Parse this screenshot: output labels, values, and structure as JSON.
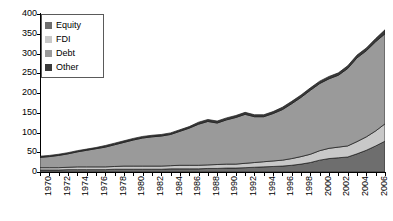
{
  "chart_data": {
    "type": "area",
    "stacked": true,
    "title": "",
    "xlabel": "",
    "ylabel": "",
    "ylim": [
      0,
      400
    ],
    "ytick_values": [
      0,
      50,
      100,
      150,
      200,
      250,
      300,
      350,
      400
    ],
    "grid": false,
    "legend_position": "top-left",
    "x": [
      1970,
      1971,
      1972,
      1973,
      1974,
      1975,
      1976,
      1977,
      1978,
      1979,
      1980,
      1981,
      1982,
      1983,
      1984,
      1985,
      1986,
      1987,
      1988,
      1989,
      1990,
      1991,
      1992,
      1993,
      1994,
      1995,
      1996,
      1997,
      1998,
      1999,
      2000,
      2001,
      2002,
      2003,
      2004,
      2005,
      2006,
      2007
    ],
    "xtick_labels": [
      "1970",
      "1972",
      "1974",
      "1976",
      "1978",
      "1980",
      "1982",
      "1984",
      "1986",
      "1988",
      "1990",
      "1992",
      "1994",
      "1996",
      "1998",
      "2000",
      "2002",
      "2004",
      "2006"
    ],
    "series": [
      {
        "name": "Equity",
        "color": "#6e6e6e",
        "values": [
          5,
          5,
          5,
          6,
          6,
          6,
          6,
          6,
          7,
          7,
          7,
          7,
          7,
          7,
          8,
          8,
          8,
          8,
          9,
          9,
          10,
          10,
          11,
          12,
          13,
          14,
          15,
          17,
          20,
          24,
          30,
          34,
          36,
          38,
          46,
          55,
          66,
          78
        ]
      },
      {
        "name": "FDI",
        "color": "#c8c8c8",
        "values": [
          6,
          6,
          6,
          6,
          7,
          7,
          7,
          7,
          7,
          8,
          8,
          8,
          8,
          8,
          8,
          9,
          9,
          9,
          9,
          10,
          10,
          10,
          11,
          12,
          13,
          14,
          15,
          17,
          19,
          21,
          24,
          26,
          27,
          28,
          31,
          34,
          38,
          44
        ]
      },
      {
        "name": "Debt",
        "color": "#9a9a9a",
        "values": [
          26,
          28,
          31,
          34,
          38,
          42,
          46,
          50,
          55,
          60,
          66,
          71,
          74,
          76,
          79,
          86,
          94,
          104,
          110,
          105,
          112,
          118,
          124,
          116,
          114,
          120,
          128,
          139,
          150,
          162,
          170,
          176,
          182,
          196,
          212,
          218,
          226,
          228
        ]
      },
      {
        "name": "Other",
        "color": "#3a3a3a",
        "values": [
          3,
          3,
          3,
          3,
          3,
          3,
          3,
          4,
          4,
          4,
          4,
          4,
          4,
          4,
          4,
          4,
          4,
          5,
          5,
          5,
          5,
          5,
          5,
          5,
          5,
          5,
          6,
          6,
          6,
          6,
          6,
          6,
          6,
          7,
          7,
          7,
          8,
          10
        ]
      }
    ]
  },
  "legend": {
    "items": [
      {
        "label": "Equity"
      },
      {
        "label": "FDI"
      },
      {
        "label": "Debt"
      },
      {
        "label": "Other"
      }
    ]
  }
}
